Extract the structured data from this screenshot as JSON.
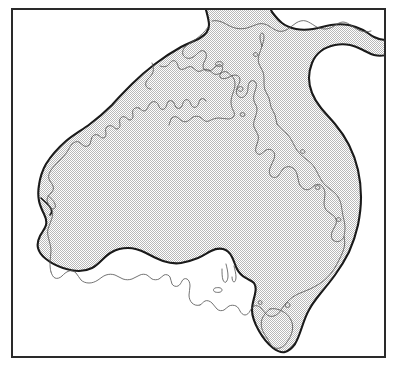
{
  "figure": {
    "type": "map",
    "region": "Australia",
    "projection_hint": "plate-carree",
    "background_color": "#ffffff",
    "frame": {
      "name": "map-frame",
      "stroke_color": "#2a2a2a",
      "stroke_width_px": 2,
      "x": 11,
      "y": 8,
      "width": 375,
      "height": 350
    },
    "layers": [
      {
        "name": "continental-shelf",
        "label": "Continental shelf edge",
        "stroke_color": "#1a1a1a",
        "stroke_width_px": 2.1,
        "fill_pattern": "stipple",
        "fill_pattern_color": "#b9b9b9",
        "fill_pattern_size_px": 2
      },
      {
        "name": "coastline",
        "label": "Coastline",
        "stroke_color": "#5a5a5a",
        "stroke_width_px": 0.8,
        "fill": "none"
      }
    ],
    "features": [
      "Cape York Peninsula",
      "Gulf of Carpentaria",
      "Arnhem Land",
      "Kimberley Coast",
      "Great Australian Bight",
      "Bass Strait",
      "Tasmania",
      "Arafura Sea shelf",
      "Torres Strait shelf"
    ],
    "colors": {
      "frame": "#2a2a2a",
      "shelf_outline": "#1a1a1a",
      "coastline": "#5a5a5a",
      "stipple": "#b9b9b9",
      "paper": "#ffffff"
    }
  }
}
